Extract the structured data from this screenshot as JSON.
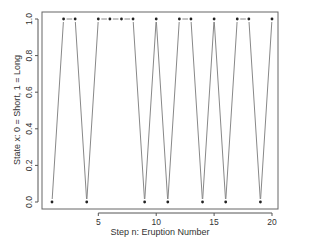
{
  "chart_data": {
    "type": "line",
    "title": "",
    "xlabel": "Step n: Eruption Number",
    "ylabel": "State x: 0 = Short, 1 = Long",
    "x": [
      1,
      2,
      3,
      4,
      5,
      6,
      7,
      8,
      9,
      10,
      11,
      12,
      13,
      14,
      15,
      16,
      17,
      18,
      19,
      20
    ],
    "series": [
      {
        "name": "state",
        "values": [
          0,
          1,
          1,
          0,
          1,
          1,
          1,
          1,
          0,
          1,
          0,
          1,
          1,
          0,
          1,
          0,
          1,
          1,
          0,
          1
        ]
      }
    ],
    "xticks": [
      5,
      10,
      15,
      20
    ],
    "yticks": [
      0.0,
      0.2,
      0.4,
      0.6,
      0.8,
      1.0
    ],
    "ytick_labels": [
      "0.0",
      "0.2",
      "0.4",
      "0.6",
      "0.8",
      "1.0"
    ],
    "xlim": [
      0.2,
      20.8
    ],
    "ylim": [
      -0.04,
      1.04
    ],
    "grid": false,
    "legend": null,
    "colors": {
      "line": "#888888",
      "point": "#222222",
      "axis": "#555555"
    }
  }
}
